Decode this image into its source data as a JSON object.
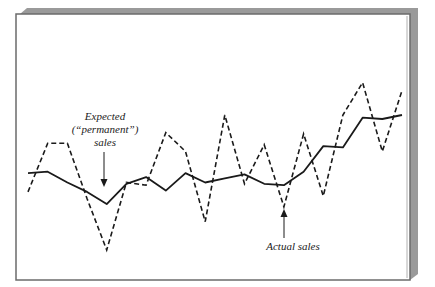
{
  "chart_data": {
    "type": "line",
    "title": "",
    "xlabel": "",
    "ylabel": "",
    "grid": false,
    "legend": "none (inline annotations with arrows)",
    "x": [
      1,
      2,
      3,
      4,
      5,
      6,
      7,
      8,
      9,
      10,
      11,
      12,
      13,
      14,
      15,
      16,
      17,
      18,
      19,
      20
    ],
    "series": [
      {
        "name": "Expected (\"permanent\") sales",
        "style": "solid",
        "values": [
          57,
          58,
          50,
          43,
          34,
          49,
          54,
          44,
          57,
          50,
          53,
          56,
          49,
          48,
          58,
          77,
          76,
          98,
          97,
          100
        ]
      },
      {
        "name": "Actual sales",
        "style": "dashed",
        "values": [
          43,
          79,
          79,
          38,
          0,
          50,
          48,
          87,
          73,
          21,
          100,
          49,
          78,
          32,
          86,
          40,
          100,
          124,
          73,
          118
        ]
      }
    ],
    "annotations": [
      {
        "text": "Expected (“permanent”) sales",
        "points_to": "solid line minimum near x=5",
        "arrow": "down"
      },
      {
        "text": "Actual sales",
        "points_to": "dashed line dip near x=14",
        "arrow": "up"
      }
    ]
  },
  "labels": {
    "expected_line1": "Expected",
    "expected_line2": "(“permanent”)",
    "expected_line3": "sales",
    "actual": "Actual sales"
  },
  "colors": {
    "line": "#1a1a1a",
    "frame": "#6b6b6b",
    "shadow": "#9a9a9a",
    "background": "#ffffff"
  }
}
